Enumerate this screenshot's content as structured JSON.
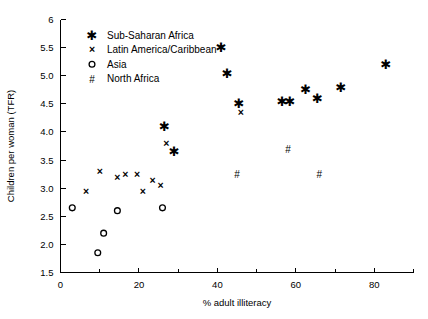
{
  "chart_data": {
    "type": "scatter",
    "title": "",
    "xlabel": "% adult illiteracy",
    "ylabel": "Children per woman (TFR)",
    "xlim": [
      0,
      90
    ],
    "ylim": [
      1.5,
      6
    ],
    "xticks": [
      0,
      20,
      40,
      60,
      80
    ],
    "xtick_labels": [
      "0",
      "20",
      "40",
      "60",
      "80"
    ],
    "xminor_ticks": [
      10,
      30,
      50,
      70,
      90
    ],
    "yticks": [
      1.5,
      2.0,
      2.5,
      3.0,
      3.5,
      4.0,
      4.5,
      5.0,
      5.5,
      6
    ],
    "ytick_labels": [
      "1.5",
      "2.0",
      "2.5",
      "3.0",
      "3.5",
      "4.0",
      "4.5",
      "5.0",
      "5.5",
      "6"
    ],
    "grid": false,
    "legend_position": "top-left",
    "series": [
      {
        "name": "Sub-Saharan Africa",
        "marker": "star",
        "points": [
          [
            26.5,
            4.1
          ],
          [
            29.0,
            3.65
          ],
          [
            41.0,
            5.5
          ],
          [
            42.5,
            5.05
          ],
          [
            45.5,
            4.5
          ],
          [
            56.5,
            4.55
          ],
          [
            58.5,
            4.55
          ],
          [
            62.5,
            4.75
          ],
          [
            65.5,
            4.6
          ],
          [
            71.5,
            4.8
          ],
          [
            83.0,
            5.2
          ]
        ]
      },
      {
        "name": "Latin America/Caribbean",
        "marker": "x",
        "points": [
          [
            6.5,
            2.95
          ],
          [
            10.0,
            3.3
          ],
          [
            14.5,
            3.2
          ],
          [
            16.5,
            3.25
          ],
          [
            19.5,
            3.25
          ],
          [
            21.0,
            2.95
          ],
          [
            23.5,
            3.15
          ],
          [
            25.5,
            3.05
          ],
          [
            27.0,
            3.8
          ],
          [
            46.0,
            4.35
          ]
        ]
      },
      {
        "name": "Asia",
        "marker": "circle",
        "points": [
          [
            3.0,
            2.65
          ],
          [
            9.5,
            1.85
          ],
          [
            11.0,
            2.2
          ],
          [
            14.5,
            2.6
          ],
          [
            26.0,
            2.65
          ]
        ]
      },
      {
        "name": "North Africa",
        "marker": "hash",
        "points": [
          [
            45.0,
            3.25
          ],
          [
            58.0,
            3.7
          ],
          [
            66.0,
            3.25
          ]
        ]
      }
    ]
  },
  "legend": {
    "items": [
      {
        "label": "Sub-Saharan Africa",
        "marker": "star"
      },
      {
        "label": "Latin America/Caribbean",
        "marker": "x"
      },
      {
        "label": "Asia",
        "marker": "circle"
      },
      {
        "label": "North Africa",
        "marker": "hash"
      }
    ]
  }
}
